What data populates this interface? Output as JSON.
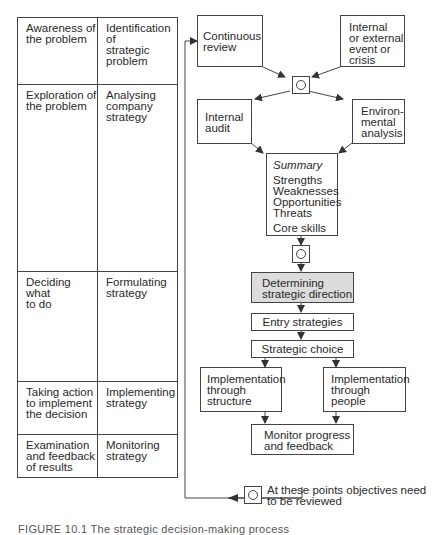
{
  "figure": {
    "caption": "FIGURE 10.1   The strategic decision-making process"
  },
  "table": {
    "rows": [
      {
        "stage": [
          "Awareness of",
          "the problem"
        ],
        "strategy": [
          "Identification of",
          "strategic",
          "problem"
        ]
      },
      {
        "stage": [
          "Exploration of",
          "the problem"
        ],
        "strategy": [
          "Analysing",
          "company",
          "strategy"
        ]
      },
      {
        "stage": [
          "Deciding what",
          "to do"
        ],
        "strategy": [
          "Formulating",
          "strategy"
        ]
      },
      {
        "stage": [
          "Taking action",
          "to implement",
          "the decision"
        ],
        "strategy": [
          "Implementing",
          "strategy"
        ]
      },
      {
        "stage": [
          "Examination",
          "and feedback",
          "of results"
        ],
        "strategy": [
          "Monitoring",
          "strategy"
        ]
      }
    ]
  },
  "flow": {
    "continuous_review": [
      "Continuous",
      "review"
    ],
    "event": [
      "Internal",
      "or external",
      "event or",
      "crisis"
    ],
    "internal_audit": [
      "Internal",
      "audit"
    ],
    "environmental_analysis": [
      "Environ-",
      "mental",
      "analysis"
    ],
    "summary": {
      "title": "Summary",
      "items": [
        "Strengths",
        "Weaknesses",
        "Opportunities",
        "Threats"
      ],
      "extra": "Core skills"
    },
    "determining": [
      "Determining",
      "strategic direction"
    ],
    "entry": "Entry strategies",
    "choice": "Strategic choice",
    "impl_structure": [
      "Implementation",
      "through",
      "structure"
    ],
    "impl_people": [
      "Implementation",
      "through",
      "people"
    ],
    "monitor": [
      "Monitor progress",
      "and feedback"
    ]
  },
  "legend": {
    "icon": "review-point-icon",
    "text": [
      "At these points objectives need",
      "to be reviewed"
    ]
  }
}
